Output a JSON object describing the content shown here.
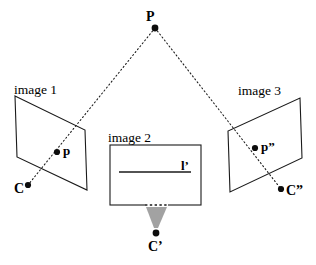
{
  "figure": {
    "background_color": "#ffffff",
    "stroke_color": "#1a1a1a",
    "cone_color": "#8c8c8c",
    "width": 316,
    "height": 265
  },
  "labels": {
    "image1": "image 1",
    "image2": "image 2",
    "image3": "image 3",
    "point_P": "P",
    "point_p": "p",
    "point_p2": "p”",
    "center_C": "C",
    "center_C1": "C’",
    "center_C2": "C”",
    "line_l": "l’"
  },
  "geometry": {
    "scene_point_P": {
      "x": 155,
      "y": 28
    },
    "image1_plane": {
      "name": "image 1",
      "corners": [
        [
          15,
          96
        ],
        [
          85,
          130
        ],
        [
          87,
          190
        ],
        [
          17,
          157
        ]
      ]
    },
    "image2_plane": {
      "name": "image 2",
      "rect": {
        "x": 110,
        "y": 145,
        "w": 91,
        "h": 60
      },
      "epipolar_line": {
        "x1": 119,
        "y1": 172,
        "x2": 191,
        "y2": 172
      }
    },
    "image3_plane": {
      "name": "image 3",
      "corners": [
        [
          300,
          98
        ],
        [
          302,
          158
        ],
        [
          230,
          192
        ],
        [
          228,
          131
        ]
      ]
    },
    "image_point_p": {
      "x": 57,
      "y": 152
    },
    "image_point_p2": {
      "x": 255,
      "y": 148
    },
    "camera_center_C": {
      "x": 28,
      "y": 185
    },
    "camera_center_C1": {
      "x": 156,
      "y": 233
    },
    "camera_center_C2": {
      "x": 281,
      "y": 189
    },
    "ray_P_to_C": {
      "x1": 155,
      "y1": 28,
      "x2": 28,
      "y2": 185
    },
    "ray_P_to_C2": {
      "x1": 155,
      "y1": 28,
      "x2": 281,
      "y2": 189
    },
    "cone_apex": {
      "x": 156,
      "y": 228
    },
    "cone_base": {
      "x1": 146,
      "y1": 206,
      "x2": 167,
      "y2": 206
    }
  }
}
